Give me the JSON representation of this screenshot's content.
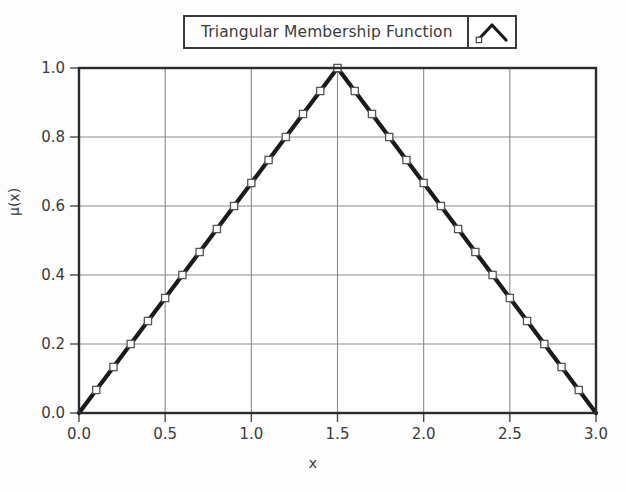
{
  "figure": {
    "background_color": "#fdfdfd",
    "plot_background_color": "#ffffff",
    "frame_color": "#2b2b2b",
    "grid_color": "#8a8a8a",
    "series_color": "#1a1a1a",
    "marker_face_color": "#ffffff",
    "marker_edge_color": "#555555",
    "text_color": "#3b3b3b"
  },
  "legend": {
    "label": "Triangular Membership Function",
    "sample_icon": "triangle-line-marker-icon",
    "position": "top-center"
  },
  "axes": {
    "x_title": "x",
    "y_title": "μ(x)",
    "x_tick_labels": [
      "0.0",
      "0.5",
      "1.0",
      "1.5",
      "2.0",
      "2.5",
      "3.0"
    ],
    "y_tick_labels": [
      "0.0",
      "0.2",
      "0.4",
      "0.6",
      "0.8",
      "1.0"
    ]
  },
  "chart_data": {
    "type": "line",
    "title": "",
    "subtitle": "",
    "xlabel": "x",
    "ylabel": "μ(x)",
    "xlim": [
      0.0,
      3.0
    ],
    "ylim": [
      0.0,
      1.0
    ],
    "xticks": [
      0.0,
      0.5,
      1.0,
      1.5,
      2.0,
      2.5,
      3.0
    ],
    "yticks": [
      0.0,
      0.2,
      0.4,
      0.6,
      0.8,
      1.0
    ],
    "grid": true,
    "legend_position": "top-center",
    "marker": "square-open",
    "series": [
      {
        "name": "Triangular Membership Function",
        "color": "#1a1a1a",
        "x": [
          0.0,
          0.1,
          0.2,
          0.3,
          0.4,
          0.5,
          0.6,
          0.7,
          0.8,
          0.9,
          1.0,
          1.1,
          1.2,
          1.3,
          1.4,
          1.5,
          1.6,
          1.7,
          1.8,
          1.9,
          2.0,
          2.1,
          2.2,
          2.3,
          2.4,
          2.5,
          2.6,
          2.7,
          2.8,
          2.9,
          3.0
        ],
        "values": [
          0.0,
          0.0667,
          0.1333,
          0.2,
          0.2667,
          0.3333,
          0.4,
          0.4667,
          0.5333,
          0.6,
          0.6667,
          0.7333,
          0.8,
          0.8667,
          0.9333,
          1.0,
          0.9333,
          0.8667,
          0.8,
          0.7333,
          0.6667,
          0.6,
          0.5333,
          0.4667,
          0.4,
          0.3333,
          0.2667,
          0.2,
          0.1333,
          0.0667,
          0.0
        ]
      }
    ],
    "annotations": {
      "peak_x": 1.5,
      "peak_y": 1.0,
      "left_foot_x": 0.0,
      "right_foot_x": 3.0
    }
  }
}
